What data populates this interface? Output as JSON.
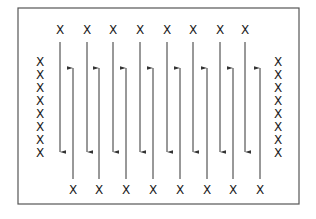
{
  "diagram": {
    "marker_glyph": "X",
    "colors": {
      "line": "#333333",
      "border": "#555555",
      "marker": "#1a1a1a",
      "background": "#ffffff"
    },
    "border": {
      "x": 18,
      "y": 8,
      "width": 281,
      "height": 196
    },
    "top_markers_x": [
      60,
      87,
      113,
      140,
      167,
      193,
      220,
      245
    ],
    "top_markers_y": 30,
    "bottom_markers_x": [
      73,
      99,
      126,
      153,
      180,
      207,
      233,
      260
    ],
    "bottom_markers_y": 190,
    "left_column": {
      "x": 40,
      "y_values": [
        62,
        75,
        88,
        101,
        114,
        127,
        140,
        153
      ]
    },
    "right_column": {
      "x": 278,
      "y_values": [
        62,
        75,
        88,
        101,
        114,
        127,
        140,
        153
      ]
    },
    "down_arrows": {
      "x": [
        60,
        87,
        113,
        140,
        167,
        193,
        220,
        245
      ],
      "y_start": 42,
      "y_end": 152
    },
    "up_arrows": {
      "x": [
        73,
        99,
        126,
        153,
        180,
        207,
        233,
        260
      ],
      "y_start": 179,
      "y_end": 68
    }
  }
}
